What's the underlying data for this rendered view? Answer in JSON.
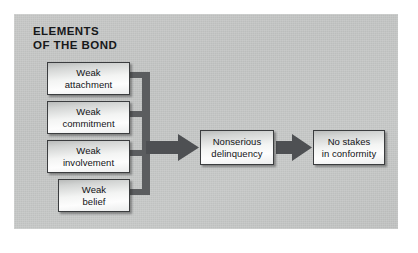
{
  "figure": {
    "title_lines": [
      "ELEMENTS",
      "OF THE BOND"
    ],
    "panel_color": "#c6c8c7",
    "box_border_color": "#3b3d3f",
    "connector_color": "#595b5d",
    "arrow_color": "#4e5053",
    "text_color": "#121316"
  },
  "nodes": {
    "weak_attachment": "Weak\nattachment",
    "weak_commitment": "Weak\ncommitment",
    "weak_involvement": "Weak\ninvolvement",
    "weak_belief": "Weak\nbelief",
    "nonserious_delinquency": "Nonserious\ndelinquency",
    "no_stakes_in_conformity": "No stakes\nin conformity"
  },
  "flow": {
    "inputs": [
      "Weak attachment",
      "Weak commitment",
      "Weak involvement",
      "Weak belief"
    ],
    "stage_two": "Nonserious delinquency",
    "stage_three": "No stakes in conformity",
    "arrows": [
      {
        "from": "elements-bus",
        "to": "Nonserious delinquency"
      },
      {
        "from": "Nonserious delinquency",
        "to": "No stakes in conformity"
      }
    ]
  }
}
